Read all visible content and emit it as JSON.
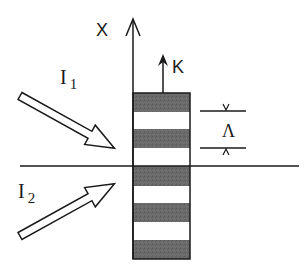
{
  "diagram": {
    "type": "grating-interference",
    "axis": {
      "label": "X"
    },
    "grating_vector": {
      "label": "K"
    },
    "period": {
      "label": "Λ"
    },
    "beams": [
      {
        "label": "I",
        "subscript": "1",
        "direction": "incident-from-upper-left"
      },
      {
        "label": "I",
        "subscript": "2",
        "direction": "incident-from-lower-left"
      }
    ],
    "grating": {
      "stripes": [
        "dark",
        "light",
        "dark",
        "light",
        "dark",
        "light",
        "dark",
        "light",
        "dark"
      ]
    },
    "colors": {
      "stroke": "#1a1a1a",
      "dark_stripe": "#6b6b6b",
      "light_stripe": "#ffffff"
    }
  }
}
